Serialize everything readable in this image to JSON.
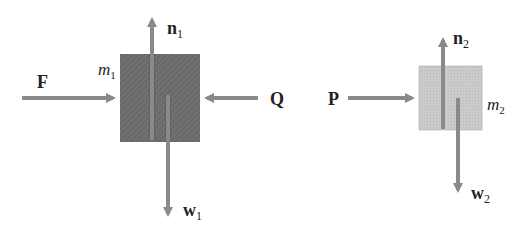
{
  "diagram": {
    "colors": {
      "block1_fill": "#6f6f6f",
      "block2_fill": "#c9c9c9",
      "arrow": "#8a8a8a",
      "text": "#222222"
    },
    "block1": {
      "mass_label": "m",
      "mass_sub": "1",
      "forces": {
        "applied_left": {
          "symbol": "F"
        },
        "applied_right": {
          "symbol": "Q"
        },
        "normal": {
          "symbol": "n",
          "sub": "1"
        },
        "weight": {
          "symbol": "w",
          "sub": "1"
        }
      }
    },
    "block2": {
      "mass_label": "m",
      "mass_sub": "2",
      "forces": {
        "applied_left": {
          "symbol": "P"
        },
        "normal": {
          "symbol": "n",
          "sub": "2"
        },
        "weight": {
          "symbol": "w",
          "sub": "2"
        }
      }
    }
  }
}
